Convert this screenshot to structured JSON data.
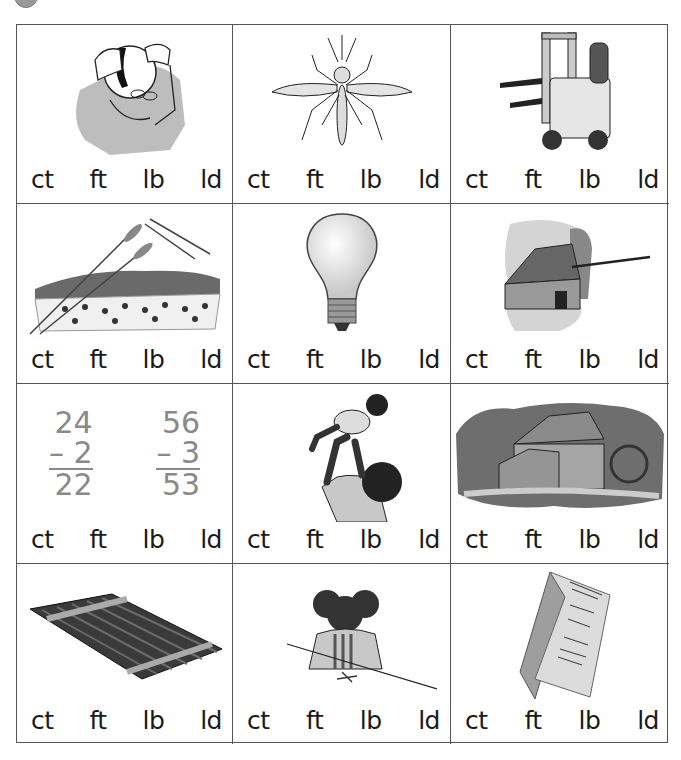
{
  "header": {
    "badge_icon": "number-circle-icon"
  },
  "options": [
    "ct",
    "ft",
    "lb",
    "ld"
  ],
  "cells": [
    {
      "picture": "man-checking-bald-spot",
      "options": [
        "ct",
        "ft",
        "lb",
        "ld"
      ]
    },
    {
      "picture": "mosquito",
      "options": [
        "ct",
        "ft",
        "lb",
        "ld"
      ]
    },
    {
      "picture": "forklift",
      "options": [
        "ct",
        "ft",
        "lb",
        "ld"
      ]
    },
    {
      "picture": "wheat-field",
      "options": [
        "ct",
        "ft",
        "lb",
        "ld"
      ]
    },
    {
      "picture": "light-bulb",
      "options": [
        "ct",
        "ft",
        "lb",
        "ld"
      ]
    },
    {
      "picture": "barn-with-arrow",
      "options": [
        "ct",
        "ft",
        "lb",
        "ld"
      ]
    },
    {
      "picture": "subtraction-problems",
      "math": [
        {
          "top": "24",
          "sub": "–  2",
          "result": "22"
        },
        {
          "top": "56",
          "sub": "–  3",
          "result": "53"
        }
      ],
      "options": [
        "ct",
        "ft",
        "lb",
        "ld"
      ]
    },
    {
      "picture": "father-lifting-child",
      "options": [
        "ct",
        "ft",
        "lb",
        "ld"
      ]
    },
    {
      "picture": "mill-with-waterwheel",
      "options": [
        "ct",
        "ft",
        "lb",
        "ld"
      ]
    },
    {
      "picture": "raft",
      "options": [
        "ct",
        "ft",
        "lb",
        "ld"
      ]
    },
    {
      "picture": "girl-cutting-with-scissors",
      "options": [
        "ct",
        "ft",
        "lb",
        "ld"
      ]
    },
    {
      "picture": "folded-leaflet",
      "options": [
        "ct",
        "ft",
        "lb",
        "ld"
      ]
    }
  ],
  "colors": {
    "grid_line": "#555555",
    "illustration_gray": "#b8b8b8",
    "math_gray": "#8a8a8a"
  }
}
